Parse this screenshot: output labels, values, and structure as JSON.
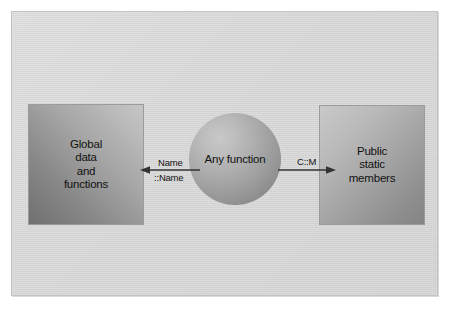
{
  "diagram": {
    "background_color": "#d6d6d6",
    "frame_border_color": "#c2c2c2",
    "nodes": [
      {
        "id": "global",
        "shape": "rectangle",
        "label": "Global\ndata\nand\nfunctions",
        "lines": [
          "Global",
          "data",
          "and",
          "functions"
        ],
        "position": "left",
        "fill": "gradient-gray-dark-to-light"
      },
      {
        "id": "any-function",
        "shape": "circle",
        "label": "Any function",
        "lines": [
          "Any function"
        ],
        "position": "center",
        "fill": "radial-gradient-sphere"
      },
      {
        "id": "public-static",
        "shape": "rectangle",
        "label": "Public\nstatic\nmembers",
        "lines": [
          "Public",
          "static",
          "members"
        ],
        "position": "right",
        "fill": "gradient-gray-light-to-dark"
      }
    ],
    "edges": [
      {
        "id": "edge-left",
        "from": "any-function",
        "to": "global",
        "direction": "left",
        "arrowhead": "end",
        "label_top": "Name",
        "label_bottom": "::Name"
      },
      {
        "id": "edge-right",
        "from": "any-function",
        "to": "public-static",
        "direction": "right",
        "arrowhead": "end",
        "label_top": "C::M",
        "label_bottom": ""
      }
    ],
    "line_color": "#333333"
  }
}
